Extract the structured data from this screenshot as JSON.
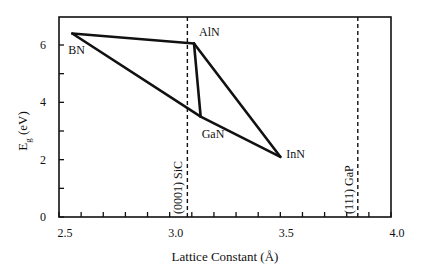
{
  "chart_data": {
    "type": "line",
    "title": "",
    "xlabel": "Lattice Constant (Å)",
    "ylabel": "E_g (eV)",
    "ylabel_main": "E",
    "ylabel_sub": "g",
    "ylabel_unit": " (eV)",
    "xlim": [
      2.5,
      4.0
    ],
    "ylim": [
      0,
      7
    ],
    "x_ticks_major": [
      2.5,
      3.0,
      3.5,
      4.0
    ],
    "x_tick_labels": [
      "2.5",
      "3.0",
      "3.5",
      "4.0"
    ],
    "x_ticks_minor_step": 0.1,
    "y_ticks_major": [
      0,
      2,
      4,
      6
    ],
    "y_tick_labels": [
      "0",
      "2",
      "4",
      "6"
    ],
    "y_ticks_minor_step": 1,
    "grid": false,
    "legend": null,
    "points": [
      {
        "name": "BN",
        "x": 2.56,
        "y": 6.4
      },
      {
        "name": "AlN",
        "x": 3.11,
        "y": 6.05
      },
      {
        "name": "GaN",
        "x": 3.14,
        "y": 3.5
      },
      {
        "name": "InN",
        "x": 3.5,
        "y": 2.1
      }
    ],
    "segments": [
      [
        "BN",
        "AlN"
      ],
      [
        "AlN",
        "GaN"
      ],
      [
        "AlN",
        "InN"
      ],
      [
        "BN",
        "GaN"
      ],
      [
        "GaN",
        "InN"
      ]
    ],
    "reference_lines": [
      {
        "label": "(0001) SiC",
        "x": 3.08,
        "style": "dashed"
      },
      {
        "label": "(111) GaP",
        "x": 3.85,
        "style": "dashed"
      }
    ]
  }
}
